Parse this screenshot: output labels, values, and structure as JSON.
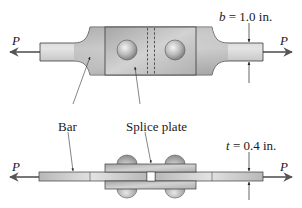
{
  "figure": {
    "top_view": {
      "load_left": "P",
      "load_right": "P",
      "dimension_symbol": "b",
      "dimension_value": " = 1.0 in."
    },
    "side_view": {
      "load_left": "P",
      "load_right": "P",
      "dimension_symbol": "t",
      "dimension_value": " = 0.4 in."
    },
    "callouts": {
      "bar": "Bar",
      "splice_plate": "Splice plate"
    },
    "colors": {
      "metal_light": "#dcdcdc",
      "metal_mid": "#b4b4b4",
      "metal_dark": "#8a8a8a",
      "outline": "#3a3a3a",
      "rivet_highlight": "#f2f2f2",
      "rivet_shadow": "#7a7a7a",
      "text": "#1a1a1a"
    }
  }
}
